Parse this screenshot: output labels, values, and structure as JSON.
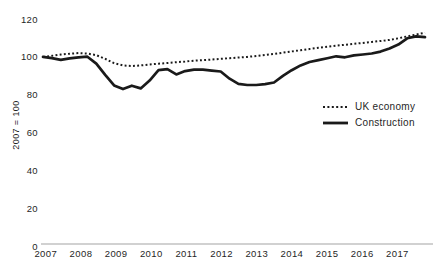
{
  "chart_data": {
    "type": "line",
    "title": "",
    "ylabel": "2007 = 100",
    "ylim": [
      0,
      120
    ],
    "y_ticks": [
      0,
      20,
      40,
      60,
      80,
      100,
      120
    ],
    "x_tick_labels": [
      "2007",
      "2008",
      "2009",
      "2010",
      "2011",
      "2012",
      "2013",
      "2014",
      "2015",
      "2016",
      "2017"
    ],
    "x_frequency": "quarterly",
    "grid": "off",
    "legend_position": "middle-right",
    "line_color": "#1a1a1a",
    "axis_line_color": "#a3a3a3",
    "series": [
      {
        "name": "UK economy",
        "style": "dotted",
        "values": [
          100,
          100.6,
          101.2,
          101.7,
          102,
          101.8,
          100.9,
          99,
          96.7,
          95.5,
          95.2,
          95.5,
          96,
          96.4,
          96.8,
          97.2,
          97.6,
          98,
          98.3,
          98.6,
          99,
          99.3,
          99.7,
          100,
          100.5,
          101,
          101.6,
          102.2,
          102.9,
          103.5,
          104.2,
          104.8,
          105.4,
          105.9,
          106.4,
          106.9,
          107.4,
          107.9,
          108.4,
          109,
          109.8,
          110.8,
          111.8,
          112.7
        ]
      },
      {
        "name": "Construction",
        "style": "solid",
        "values": [
          100,
          99.3,
          98.4,
          99.2,
          99.8,
          100.1,
          96.5,
          90.5,
          85,
          83,
          84.8,
          83.4,
          87.5,
          93,
          93.6,
          90.8,
          92.5,
          93.3,
          93.3,
          92.8,
          92.3,
          88.5,
          85.8,
          85.2,
          85.2,
          85.6,
          86.5,
          90,
          93,
          95.5,
          97.3,
          98.3,
          99.3,
          100.3,
          99.8,
          100.8,
          101.3,
          101.8,
          102.8,
          104.5,
          106.5,
          109.8,
          110.8,
          110.4
        ]
      }
    ]
  }
}
